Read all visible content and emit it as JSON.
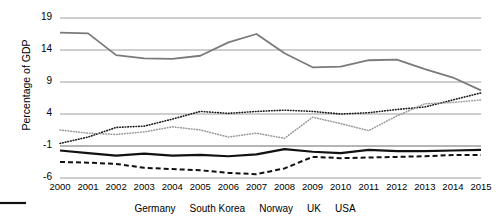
{
  "chart_data": {
    "type": "line",
    "title": "",
    "xlabel": "",
    "ylabel": "Percentage of GDP",
    "x": [
      2000,
      2001,
      2002,
      2003,
      2004,
      2005,
      2006,
      2007,
      2008,
      2009,
      2010,
      2011,
      2012,
      2013,
      2014,
      2015
    ],
    "categories": [
      "2000",
      "2001",
      "2002",
      "2003",
      "2004",
      "2005",
      "2006",
      "2007",
      "2008",
      "2009",
      "2010",
      "2011",
      "2012",
      "2013",
      "2014",
      "2015"
    ],
    "yticks": [
      19,
      14,
      9,
      4,
      -1,
      -6
    ],
    "yticklabels": [
      "19",
      "14",
      "9",
      "4",
      "-1",
      "-6"
    ],
    "ylim": [
      -7.5,
      20.5
    ],
    "grid": "horizontal",
    "legend_position": "bottom",
    "series": [
      {
        "name": "Germany",
        "style": "dotted",
        "color": "#1a1a1a",
        "width": 1.6,
        "dash": "0.6 2.1",
        "values": [
          -0.6,
          0.4,
          1.9,
          2.1,
          3.2,
          4.4,
          4.1,
          4.4,
          4.6,
          4.4,
          4.0,
          4.2,
          4.7,
          5.1,
          6.2,
          7.3
        ]
      },
      {
        "name": "South Korea",
        "style": "dotted",
        "color": "#9a9a9a",
        "width": 1.6,
        "dash": "0.6 2.1",
        "values": [
          1.5,
          1.0,
          0.8,
          1.2,
          2.0,
          1.5,
          0.4,
          1.0,
          0.2,
          3.5,
          2.5,
          1.4,
          3.7,
          5.6,
          5.8,
          6.2
        ]
      },
      {
        "name": "Norway",
        "style": "solid",
        "color": "#7a7a7a",
        "width": 1.8,
        "dash": "",
        "values": [
          16.7,
          16.6,
          13.2,
          12.7,
          12.6,
          13.1,
          15.2,
          16.5,
          13.5,
          11.3,
          11.4,
          12.4,
          12.5,
          11.0,
          9.7,
          7.7
        ]
      },
      {
        "name": "UK",
        "style": "solid",
        "color": "#111111",
        "width": 2.2,
        "dash": "",
        "values": [
          -1.7,
          -2.1,
          -2.5,
          -2.2,
          -2.5,
          -2.4,
          -2.6,
          -2.3,
          -1.5,
          -1.9,
          -2.1,
          -1.6,
          -1.8,
          -1.8,
          -1.7,
          -1.6
        ]
      },
      {
        "name": "USA",
        "style": "dashed",
        "color": "#111111",
        "width": 2.0,
        "dash": "5 3",
        "values": [
          -3.5,
          -3.6,
          -3.8,
          -4.4,
          -4.6,
          -4.8,
          -5.2,
          -5.4,
          -4.5,
          -2.7,
          -2.9,
          -2.8,
          -2.7,
          -2.6,
          -2.4,
          -2.4
        ]
      }
    ]
  },
  "axis": {
    "ylabel": "Percentage of GDP"
  },
  "legend": {
    "items": [
      {
        "label": "Germany"
      },
      {
        "label": "South Korea"
      },
      {
        "label": "Norway"
      },
      {
        "label": "UK"
      },
      {
        "label": "USA"
      }
    ]
  }
}
